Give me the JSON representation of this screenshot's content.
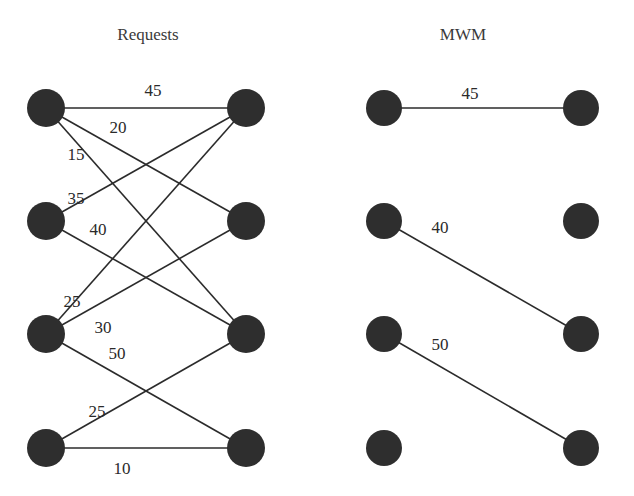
{
  "panels": [
    {
      "id": "requests",
      "title": "Requests",
      "title_pos": [
        148,
        40
      ],
      "radius": 19,
      "left_nodes": [
        [
          46,
          108
        ],
        [
          46,
          221
        ],
        [
          46,
          334
        ],
        [
          46,
          448
        ]
      ],
      "right_nodes": [
        [
          246,
          108
        ],
        [
          246,
          221
        ],
        [
          246,
          334
        ],
        [
          246,
          448
        ]
      ],
      "edges": [
        {
          "from": 0,
          "to": 0,
          "weight": "45",
          "label_pos": [
            153,
            96
          ]
        },
        {
          "from": 0,
          "to": 1,
          "weight": "20",
          "label_pos": [
            118,
            133
          ]
        },
        {
          "from": 0,
          "to": 2,
          "weight": "15",
          "label_pos": [
            76,
            160
          ]
        },
        {
          "from": 1,
          "to": 0,
          "weight": "35",
          "label_pos": [
            76,
            204
          ]
        },
        {
          "from": 1,
          "to": 2,
          "weight": "40",
          "label_pos": [
            98,
            235
          ]
        },
        {
          "from": 2,
          "to": 0,
          "weight": "25",
          "label_pos": [
            72,
            307
          ]
        },
        {
          "from": 2,
          "to": 1,
          "weight": "30",
          "label_pos": [
            103,
            333
          ]
        },
        {
          "from": 2,
          "to": 3,
          "weight": "50",
          "label_pos": [
            117,
            359
          ]
        },
        {
          "from": 3,
          "to": 2,
          "weight": "25",
          "label_pos": [
            97,
            417
          ]
        },
        {
          "from": 3,
          "to": 3,
          "weight": "10",
          "label_pos": [
            122,
            474
          ]
        }
      ]
    },
    {
      "id": "mwm",
      "title": "MWM",
      "title_pos": [
        463,
        40
      ],
      "radius": 18,
      "left_nodes": [
        [
          384,
          108
        ],
        [
          384,
          221
        ],
        [
          384,
          334
        ],
        [
          384,
          448
        ]
      ],
      "right_nodes": [
        [
          581,
          108
        ],
        [
          581,
          221
        ],
        [
          581,
          334
        ],
        [
          581,
          448
        ]
      ],
      "edges": [
        {
          "from": 0,
          "to": 0,
          "weight": "45",
          "label_pos": [
            470,
            99
          ]
        },
        {
          "from": 1,
          "to": 2,
          "weight": "40",
          "label_pos": [
            440,
            233
          ]
        },
        {
          "from": 2,
          "to": 3,
          "weight": "50",
          "label_pos": [
            440,
            350
          ]
        }
      ]
    }
  ],
  "colors": {
    "node": "#2e2e2e",
    "edge": "#2b2b2b",
    "text": "#2a2a2a",
    "background": "#ffffff"
  }
}
